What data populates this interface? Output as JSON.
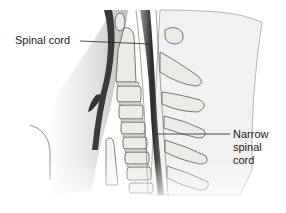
{
  "diagram": {
    "labels": [
      {
        "id": "spinal-cord",
        "text": "Spinal cord"
      },
      {
        "id": "narrow-spinal-cord",
        "lines": [
          "Narrow",
          "spinal",
          "cord"
        ]
      }
    ],
    "colors": {
      "background": "#ffffff",
      "bone_fill": "#ecece6",
      "outline": "#555555",
      "cord_dark": "#2a2a2a",
      "soft_tissue": "#e6e6e6"
    }
  }
}
